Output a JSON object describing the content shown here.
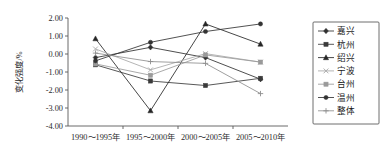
{
  "chart_data": {
    "type": "line",
    "title": "",
    "xlabel": "",
    "ylabel": "变化强度/%",
    "categories": [
      "1990～1995年",
      "1995～2000年",
      "2000～2005年",
      "2005～2010年"
    ],
    "ylim": [
      -4.0,
      2.0
    ],
    "yticks": [
      2.0,
      1.0,
      0.0,
      -1.0,
      -2.0,
      -3.0,
      -4.0
    ],
    "ytick_labels": [
      "2.00",
      "1.00",
      "0.00",
      "-1.00",
      "-2.00",
      "-3.00",
      "-4.00"
    ],
    "grid": false,
    "legend_position": "right",
    "series": [
      {
        "name": "嘉兴",
        "marker": "diamond",
        "color": "#2f2f2f",
        "values": [
          -0.2,
          0.37,
          -0.2,
          -1.4
        ]
      },
      {
        "name": "杭州",
        "marker": "square",
        "color": "#3a3a3a",
        "values": [
          -0.6,
          -1.5,
          -1.75,
          -1.35
        ]
      },
      {
        "name": "绍兴",
        "marker": "triangle",
        "color": "#262626",
        "values": [
          0.85,
          -3.15,
          1.67,
          0.55
        ]
      },
      {
        "name": "宁波",
        "marker": "light-x",
        "color": "#a8a8a8",
        "values": [
          0.28,
          -0.88,
          0.02,
          -0.45
        ]
      },
      {
        "name": "台州",
        "marker": "light-square",
        "color": "#9a9a9a",
        "values": [
          -0.55,
          -1.18,
          -0.05,
          -0.45
        ]
      },
      {
        "name": "温州",
        "marker": "dot",
        "color": "#333333",
        "values": [
          -0.38,
          0.65,
          1.25,
          1.67
        ]
      },
      {
        "name": "整体",
        "marker": "plus",
        "color": "#8e8e8e",
        "values": [
          0.05,
          -0.42,
          -0.52,
          -2.2
        ]
      }
    ]
  },
  "legend": {
    "items": [
      {
        "label": "嘉兴"
      },
      {
        "label": "杭州"
      },
      {
        "label": "绍兴"
      },
      {
        "label": "宁波"
      },
      {
        "label": "台州"
      },
      {
        "label": "温州"
      },
      {
        "label": "整体"
      }
    ]
  }
}
